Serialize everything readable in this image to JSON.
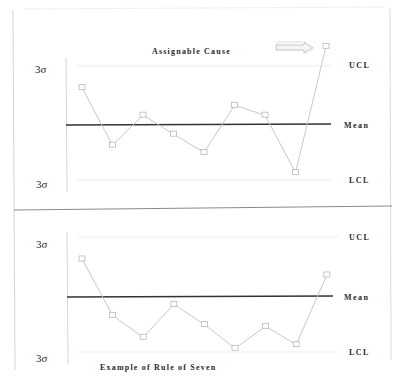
{
  "chart_data": [
    {
      "type": "line",
      "title": "Assignable Cause",
      "xlabel": "",
      "ylabel": "",
      "y_units": "sigma",
      "ylim": [
        -3,
        3
      ],
      "grid": false,
      "left_labels": {
        "top": "3σ",
        "bottom": "3σ"
      },
      "control_lines": [
        {
          "name": "UCL",
          "label": "UCL",
          "value": 3
        },
        {
          "name": "Mean",
          "label": "Mean",
          "value": 0
        },
        {
          "name": "LCL",
          "label": "LCL",
          "value": -3
        }
      ],
      "x": [
        1,
        2,
        3,
        4,
        5,
        6,
        7,
        8,
        9
      ],
      "series": [
        {
          "name": "samples",
          "values": [
            1.9,
            -1.1,
            0.5,
            -0.5,
            -1.5,
            1.0,
            0.5,
            -2.6,
            4.0
          ]
        }
      ],
      "annotations": [
        {
          "type": "arrow",
          "direction": "right",
          "points_to": "point 9 (above UCL)"
        }
      ],
      "title_placement": "top-center"
    },
    {
      "type": "line",
      "title": "Example of Rule of Seven",
      "xlabel": "",
      "ylabel": "",
      "y_units": "sigma",
      "ylim": [
        -3,
        3
      ],
      "grid": false,
      "left_labels": {
        "top": "3σ",
        "bottom": "3σ"
      },
      "control_lines": [
        {
          "name": "UCL",
          "label": "UCL",
          "value": 3
        },
        {
          "name": "Mean",
          "label": "Mean",
          "value": 0
        },
        {
          "name": "LCL",
          "label": "LCL",
          "value": -3
        }
      ],
      "x": [
        1,
        2,
        3,
        4,
        5,
        6,
        7,
        8,
        9
      ],
      "series": [
        {
          "name": "samples",
          "values": [
            1.9,
            -1.0,
            -2.2,
            -0.4,
            -1.5,
            -2.8,
            -1.6,
            -2.6,
            1.1
          ]
        }
      ],
      "title_placement": "bottom-left"
    }
  ],
  "colors": {
    "mean_line": "#333333",
    "data_line": "#c8c8c8",
    "marker": "#b8b8b8",
    "control_line": "#ededed",
    "frame": "#d0d0d0",
    "divider": "#8a8a8a"
  }
}
